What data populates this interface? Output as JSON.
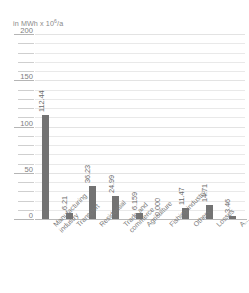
{
  "chart_data": {
    "type": "bar",
    "title": "",
    "subtitle": "",
    "unit_caption": "in MWh x 10",
    "unit_exponent": "6",
    "unit_suffix": "/a",
    "xlabel": "",
    "ylabel": "in MWh x 10⁶/a",
    "ylim": [
      0,
      200
    ],
    "ytick_labels": [
      "200",
      "150",
      "100",
      "50",
      "0"
    ],
    "ytick_values": [
      200,
      150,
      100,
      50,
      0
    ],
    "minor_tick_step": 10,
    "grid": true,
    "legend": "none",
    "bar_color": "#737373",
    "categories": [
      "Manufacturing industry",
      "Transport",
      "Residential",
      "Trade and commerce",
      "Agriculture",
      "Fishing industry",
      "Others",
      "Losses",
      "A..."
    ],
    "values": [
      112.44,
      6.21,
      36.23,
      24.99,
      6.159,
      0.0,
      11.47,
      14.71,
      3.46
    ],
    "value_labels": [
      "112.44",
      "6.21",
      "36.23",
      "24.99",
      "6.159",
      "0.000",
      "11.47",
      "14.71",
      "3.46"
    ]
  }
}
